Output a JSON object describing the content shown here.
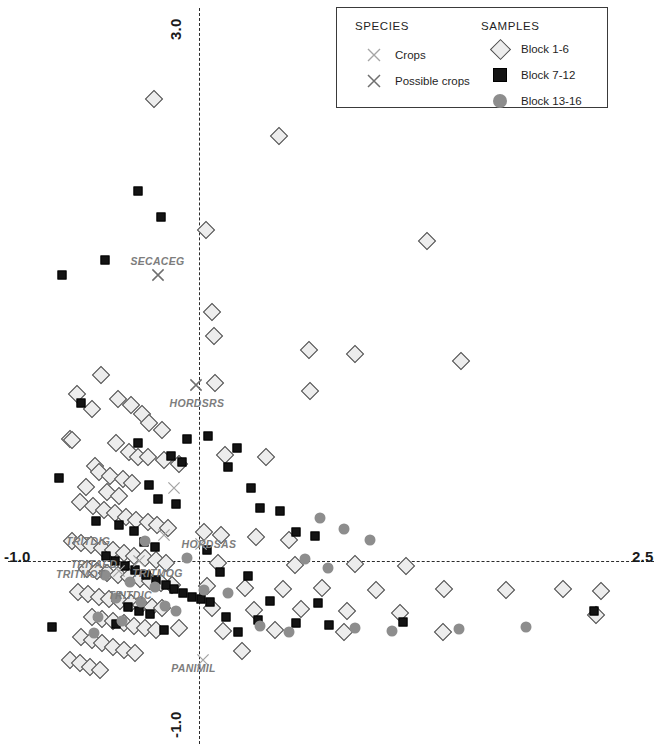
{
  "chart_data": {
    "type": "scatter",
    "title": "",
    "xlabel": "",
    "ylabel": "",
    "xlim": [
      -1.0,
      2.5
    ],
    "ylim": [
      -1.0,
      3.0
    ],
    "grid": false,
    "axis_style": "dashed-crosshair-through-origin",
    "legend_position": "top-right",
    "axis_ticks": {
      "x_min_label": "-1.0",
      "x_max_label": "2.5",
      "y_max_label": "3.0",
      "y_min_label": "-1.0"
    },
    "series": [
      {
        "name": "Block 1-6",
        "marker": "diamond",
        "color": "#ededed",
        "points": [
          [
            -0.265,
            2.645
          ],
          [
            0.462,
            2.43
          ],
          [
            0.035,
            1.897
          ],
          [
            1.325,
            1.834
          ],
          [
            0.07,
            1.425
          ],
          [
            0.083,
            1.291
          ],
          [
            0.64,
            1.206
          ],
          [
            0.905,
            1.184
          ],
          [
            1.523,
            1.145
          ],
          [
            -0.577,
            1.068
          ],
          [
            0.092,
            1.018
          ],
          [
            0.646,
            0.975
          ],
          [
            -0.716,
            0.958
          ],
          [
            -0.478,
            0.93
          ],
          [
            -0.397,
            0.895
          ],
          [
            -0.627,
            0.869
          ],
          [
            -0.338,
            0.842
          ],
          [
            -0.295,
            0.79
          ],
          [
            -0.22,
            0.752
          ],
          [
            -0.757,
            0.7
          ],
          [
            -0.742,
            0.696
          ],
          [
            -0.488,
            0.676
          ],
          [
            -0.414,
            0.628
          ],
          [
            -0.357,
            0.6
          ],
          [
            -0.3,
            0.598
          ],
          [
            -0.205,
            0.58
          ],
          [
            0.148,
            0.606
          ],
          [
            0.385,
            0.6
          ],
          [
            -0.12,
            0.56
          ],
          [
            -0.61,
            0.545
          ],
          [
            -0.585,
            0.512
          ],
          [
            -0.52,
            0.486
          ],
          [
            -0.449,
            0.47
          ],
          [
            -0.392,
            0.448
          ],
          [
            -0.66,
            0.425
          ],
          [
            -0.54,
            0.398
          ],
          [
            -0.47,
            0.372
          ],
          [
            -0.7,
            0.34
          ],
          [
            -0.622,
            0.318
          ],
          [
            -0.56,
            0.296
          ],
          [
            -0.494,
            0.276
          ],
          [
            -0.43,
            0.256
          ],
          [
            -0.368,
            0.24
          ],
          [
            -0.3,
            0.226
          ],
          [
            -0.247,
            0.208
          ],
          [
            -0.186,
            0.19
          ],
          [
            0.028,
            0.17
          ],
          [
            0.128,
            0.152
          ],
          [
            0.33,
            0.14
          ],
          [
            0.52,
            0.124
          ],
          [
            -0.742,
            0.118
          ],
          [
            -0.69,
            0.105
          ],
          [
            -0.632,
            0.092
          ],
          [
            -0.57,
            0.078
          ],
          [
            -0.505,
            0.065
          ],
          [
            -0.44,
            0.05
          ],
          [
            -0.38,
            0.034
          ],
          [
            -0.318,
            0.02
          ],
          [
            -0.256,
            0.008
          ],
          [
            -0.196,
            -0.006
          ],
          [
            0.105,
            -0.01
          ],
          [
            0.555,
            -0.022
          ],
          [
            0.905,
            -0.016
          ],
          [
            1.205,
            -0.028
          ],
          [
            -0.655,
            -0.04
          ],
          [
            -0.596,
            -0.052
          ],
          [
            -0.538,
            -0.064
          ],
          [
            -0.474,
            -0.076
          ],
          [
            -0.412,
            -0.088
          ],
          [
            -0.35,
            -0.1
          ],
          [
            -0.288,
            -0.112
          ],
          [
            -0.225,
            -0.124
          ],
          [
            -0.162,
            -0.136
          ],
          [
            0.045,
            -0.142
          ],
          [
            0.263,
            -0.15
          ],
          [
            0.485,
            -0.158
          ],
          [
            0.712,
            -0.15
          ],
          [
            1.03,
            -0.162
          ],
          [
            1.425,
            -0.155
          ],
          [
            1.79,
            -0.16
          ],
          [
            2.12,
            -0.155
          ],
          [
            2.34,
            -0.168
          ],
          [
            -0.706,
            -0.175
          ],
          [
            -0.648,
            -0.188
          ],
          [
            -0.588,
            -0.2
          ],
          [
            -0.526,
            -0.212
          ],
          [
            -0.466,
            -0.224
          ],
          [
            -0.402,
            -0.236
          ],
          [
            -0.34,
            -0.248
          ],
          [
            -0.278,
            -0.258
          ],
          [
            -0.216,
            -0.268
          ],
          [
            0.072,
            -0.268
          ],
          [
            0.318,
            -0.276
          ],
          [
            0.592,
            -0.272
          ],
          [
            0.858,
            -0.282
          ],
          [
            1.168,
            -0.292
          ],
          [
            2.315,
            -0.305
          ],
          [
            -0.628,
            -0.318
          ],
          [
            -0.566,
            -0.33
          ],
          [
            -0.505,
            -0.342
          ],
          [
            -0.442,
            -0.354
          ],
          [
            -0.38,
            -0.366
          ],
          [
            -0.318,
            -0.378
          ],
          [
            -0.256,
            -0.39
          ],
          [
            -0.118,
            -0.382
          ],
          [
            0.135,
            -0.398
          ],
          [
            0.44,
            -0.392
          ],
          [
            0.845,
            -0.4
          ],
          [
            1.42,
            -0.402
          ],
          [
            -0.69,
            -0.43
          ],
          [
            -0.63,
            -0.448
          ],
          [
            -0.57,
            -0.468
          ],
          [
            -0.505,
            -0.486
          ],
          [
            -0.44,
            -0.505
          ],
          [
            -0.378,
            -0.52
          ],
          [
            0.25,
            -0.512
          ],
          [
            -0.755,
            -0.56
          ],
          [
            -0.7,
            -0.58
          ],
          [
            -0.64,
            -0.6
          ],
          [
            -0.578,
            -0.618
          ]
        ]
      },
      {
        "name": "Block 7-12",
        "marker": "square",
        "color": "#141414",
        "points": [
          [
            -0.36,
            2.12
          ],
          [
            -0.225,
            1.968
          ],
          [
            -0.55,
            1.725
          ],
          [
            -0.8,
            1.64
          ],
          [
            -0.69,
            0.905
          ],
          [
            0.048,
            0.72
          ],
          [
            -0.072,
            0.7
          ],
          [
            -0.36,
            0.676
          ],
          [
            0.218,
            0.648
          ],
          [
            -0.168,
            0.605
          ],
          [
            -0.105,
            0.568
          ],
          [
            0.168,
            0.54
          ],
          [
            -0.818,
            0.478
          ],
          [
            -0.292,
            0.44
          ],
          [
            0.302,
            0.418
          ],
          [
            -0.24,
            0.36
          ],
          [
            -0.14,
            0.33
          ],
          [
            0.352,
            0.308
          ],
          [
            0.468,
            0.29
          ],
          [
            -0.605,
            0.232
          ],
          [
            -0.47,
            0.208
          ],
          [
            -0.385,
            0.175
          ],
          [
            0.565,
            0.168
          ],
          [
            0.672,
            0.145
          ],
          [
            -0.322,
            0.11
          ],
          [
            -0.26,
            0.082
          ],
          [
            0.042,
            0.068
          ],
          [
            -0.548,
            0.03
          ],
          [
            -0.492,
            0.005
          ],
          [
            -0.432,
            -0.024
          ],
          [
            -0.375,
            -0.05
          ],
          [
            -0.31,
            -0.075
          ],
          [
            0.118,
            -0.062
          ],
          [
            0.285,
            -0.08
          ],
          [
            -0.252,
            -0.108
          ],
          [
            -0.198,
            -0.135
          ],
          [
            -0.148,
            -0.158
          ],
          [
            -0.098,
            -0.18
          ],
          [
            -0.046,
            -0.2
          ],
          [
            0.008,
            -0.215
          ],
          [
            0.06,
            -0.232
          ],
          [
            0.41,
            -0.225
          ],
          [
            0.69,
            -0.238
          ],
          [
            -0.418,
            -0.26
          ],
          [
            -0.352,
            -0.282
          ],
          [
            -0.29,
            -0.302
          ],
          [
            0.155,
            -0.318
          ],
          [
            0.34,
            -0.332
          ],
          [
            -0.488,
            -0.355
          ],
          [
            0.56,
            -0.352
          ],
          [
            0.755,
            -0.36
          ],
          [
            1.188,
            -0.348
          ],
          [
            2.3,
            -0.285
          ],
          [
            -0.862,
            -0.372
          ],
          [
            -0.205,
            -0.392
          ],
          [
            0.222,
            -0.4
          ]
        ]
      },
      {
        "name": "Block 13-16",
        "marker": "circle",
        "color": "#8d8d8d",
        "points": [
          [
            0.705,
            0.248
          ],
          [
            0.845,
            0.185
          ],
          [
            0.992,
            0.122
          ],
          [
            -0.318,
            0.118
          ],
          [
            -0.072,
            0.02
          ],
          [
            0.618,
            0.016
          ],
          [
            0.752,
            -0.035
          ],
          [
            -0.552,
            -0.078
          ],
          [
            -0.405,
            -0.115
          ],
          [
            -0.262,
            -0.145
          ],
          [
            0.028,
            -0.16
          ],
          [
            0.165,
            -0.178
          ],
          [
            -0.485,
            -0.21
          ],
          [
            -0.34,
            -0.232
          ],
          [
            -0.202,
            -0.255
          ],
          [
            -0.14,
            -0.285
          ],
          [
            -0.59,
            -0.318
          ],
          [
            -0.455,
            -0.34
          ],
          [
            0.355,
            -0.368
          ],
          [
            0.52,
            -0.402
          ],
          [
            0.905,
            -0.38
          ],
          [
            1.12,
            -0.395
          ],
          [
            1.512,
            -0.385
          ],
          [
            1.905,
            -0.372
          ],
          [
            -0.618,
            -0.408
          ]
        ]
      },
      {
        "name": "Crops",
        "marker": "cross-light",
        "color": "#9a9a9a",
        "points": [
          [
            -0.148,
            0.42
          ],
          [
            -0.21,
            0.152
          ],
          [
            0.008,
            0.1
          ],
          [
            -0.352,
            0.002
          ],
          [
            -0.468,
            -0.055
          ],
          [
            0.02,
            -0.56
          ]
        ]
      },
      {
        "name": "Possible crops",
        "marker": "cross-dark",
        "color": "#6f6f6f",
        "points": [
          [
            -0.24,
            1.64
          ],
          [
            -0.02,
            1.01
          ]
        ]
      }
    ],
    "species_labels": [
      {
        "text": "SECACEG",
        "x": -0.245,
        "y": 1.72
      },
      {
        "text": "HORDSRS",
        "x": -0.015,
        "y": 0.905
      },
      {
        "text": "TRITDIG",
        "x": -0.65,
        "y": 0.118
      },
      {
        "text": "HORDSAS",
        "x": 0.055,
        "y": 0.1
      },
      {
        "text": "TRITAED",
        "x": -0.615,
        "y": -0.012
      },
      {
        "text": "TRITMOG",
        "x": -0.245,
        "y": -0.068
      },
      {
        "text": "TRITMOT",
        "x": -0.695,
        "y": -0.07
      },
      {
        "text": "TRITDIC",
        "x": -0.405,
        "y": -0.192
      },
      {
        "text": "PANIMIL",
        "x": -0.035,
        "y": -0.608
      }
    ]
  },
  "legend": {
    "species_heading": "SPECIES",
    "samples_heading": "SAMPLES",
    "species_items": [
      {
        "label": "Crops",
        "marker": "cross-light"
      },
      {
        "label": "Possible crops",
        "marker": "cross-dark"
      }
    ],
    "samples_items": [
      {
        "label": "Block 1-6",
        "marker": "diamond"
      },
      {
        "label": "Block 7-12",
        "marker": "square"
      },
      {
        "label": "Block 13-16",
        "marker": "circle"
      }
    ]
  }
}
